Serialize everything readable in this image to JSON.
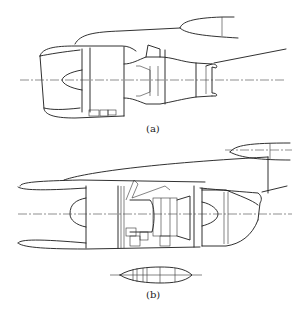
{
  "figure": {
    "panels": [
      {
        "id": "a",
        "label": "(a)",
        "description": "Engine nacelle mounted under wing with pylon, fan cowl and exhaust nozzle"
      },
      {
        "id": "b",
        "label": "(b)",
        "description": "Engine nacelle integrated with wing, long fan cowl with plan-view section below"
      }
    ]
  },
  "colors": {
    "line": "#1a1a1a",
    "axis": "#444444",
    "background": "#ffffff"
  }
}
